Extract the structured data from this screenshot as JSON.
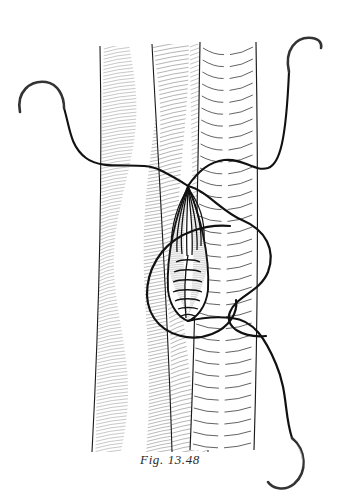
{
  "figure": {
    "caption": "Fig. 13.48",
    "background_color": "#ffffff",
    "ink_color": "#1a1a1a",
    "hatch_color": "#4a4a4a",
    "needle_color": "#333333",
    "thread_color": "#111111"
  },
  "vessels": [
    {
      "name": "left-vessel",
      "label": "Left vessel (fine longitudinal hatching)",
      "shading_style": "fine-oblique-hatch",
      "x_left": 98,
      "x_right": 196,
      "y_top": 46,
      "y_bottom": 452,
      "hatch_line_count": 120,
      "hatch_color": "#555555"
    },
    {
      "name": "middle-vessel",
      "label": "Middle vessel segment (dense hatching)",
      "shading_style": "dense-oblique-hatch",
      "x_left": 150,
      "x_right": 206,
      "y_top": 44,
      "y_bottom": 452,
      "hatch_line_count": 96,
      "hatch_color": "#4a4a4a"
    },
    {
      "name": "right-vessel",
      "label": "Right vessel (transverse ring markings)",
      "shading_style": "transverse-dashed-arcs",
      "x_left": 200,
      "x_right": 256,
      "y_top": 42,
      "y_bottom": 450,
      "ring_count": 34,
      "hatch_color": "#3d3d3d"
    }
  ],
  "wound": {
    "name": "arteriotomy-opening",
    "label": "Lens-shaped arteriotomy / anastomotic opening",
    "apex_top": {
      "x": 188,
      "y": 186
    },
    "apex_bottom": {
      "x": 188,
      "y": 321
    },
    "max_width": 46,
    "upper_strand_count": 8,
    "running_suture_rungs": 7,
    "interior_shading": "stippled-hatch"
  },
  "needles": [
    {
      "name": "needle-left",
      "label": "Curved needle, upper left",
      "position": {
        "x": 18,
        "y": 88
      },
      "orientation": "hook-opening-down-left",
      "tip": {
        "x": 19,
        "y": 110
      },
      "eye": {
        "x": 64,
        "y": 108
      }
    },
    {
      "name": "needle-top-right",
      "label": "Curved needle, upper right",
      "position": {
        "x": 286,
        "y": 34
      },
      "orientation": "hook-opening-down",
      "tip": {
        "x": 318,
        "y": 38
      },
      "eye": {
        "x": 289,
        "y": 70
      }
    },
    {
      "name": "needle-bottom-right",
      "label": "Curved needle, lower right",
      "position": {
        "x": 288,
        "y": 440
      },
      "orientation": "crescent-opening-up-left",
      "tip": {
        "x": 277,
        "y": 478
      },
      "eye": {
        "x": 297,
        "y": 444
      }
    }
  ],
  "threads": [
    {
      "name": "thread-upper-left",
      "label": "Suture thread from upper-left needle to wound apex",
      "from": "needle-left",
      "to": "apex_top"
    },
    {
      "name": "thread-upper-right",
      "label": "Suture thread from wound apex to upper-right needle",
      "from": "apex_top",
      "to": "needle-top-right"
    },
    {
      "name": "thread-loop-right",
      "label": "Large free suture loop at right of wound",
      "from": "apex_top",
      "to": "apex_bottom"
    },
    {
      "name": "thread-loop-left",
      "label": "Large free suture loop at left of wound",
      "from": "apex_top",
      "to": "apex_bottom"
    },
    {
      "name": "thread-lower-right",
      "label": "Suture thread from wound apex to lower-right needle",
      "from": "apex_bottom",
      "to": "needle-bottom-right"
    }
  ]
}
